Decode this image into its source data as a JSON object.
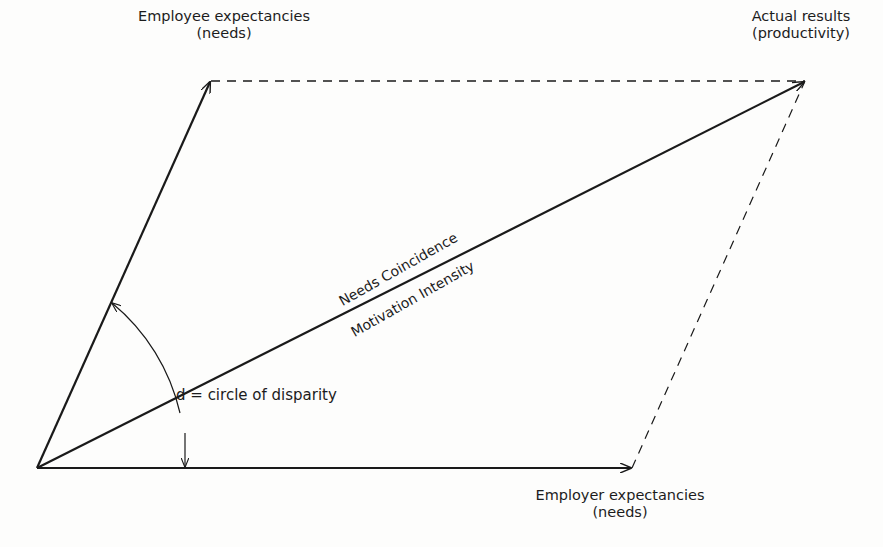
{
  "diagram": {
    "nodes": {
      "employee_expectancies": {
        "line1": "Employee expectancies",
        "line2": "(needs)"
      },
      "actual_results": {
        "line1": "Actual results",
        "line2": "(productivity)"
      },
      "employer_expectancies": {
        "line1": "Employer expectancies",
        "line2": "(needs)"
      }
    },
    "resultant_vector": {
      "label_above": "Needs Coincidence",
      "label_below": "Motivation Intensity"
    },
    "angle": {
      "label": "d = circle of disparity"
    },
    "edges": [
      {
        "from": "origin",
        "to": "employee_expectancies",
        "style": "solid",
        "arrow": true
      },
      {
        "from": "origin",
        "to": "employer_expectancies",
        "style": "solid",
        "arrow": true
      },
      {
        "from": "origin",
        "to": "actual_results",
        "style": "solid",
        "arrow": true
      },
      {
        "from": "employee_expectancies",
        "to": "actual_results",
        "style": "dashed",
        "arrow": false
      },
      {
        "from": "employer_expectancies",
        "to": "actual_results",
        "style": "dashed",
        "arrow": false
      }
    ],
    "colors": {
      "ink": "#1a1a1a",
      "paper": "#fdfdfc"
    }
  }
}
